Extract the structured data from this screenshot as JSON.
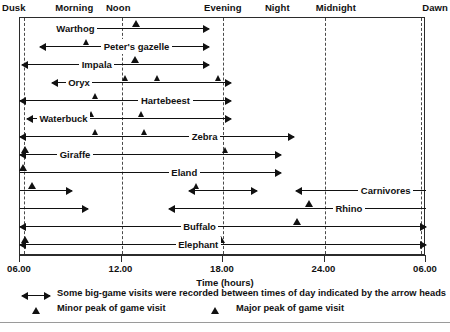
{
  "chart_data": {
    "type": "range_bar",
    "title": "",
    "xlabel": "Time (hours)",
    "ylabel": "",
    "xlim": [
      6,
      30
    ],
    "xticks": [
      {
        "value": 6,
        "label": "06.00"
      },
      {
        "value": 12,
        "label": "12.00"
      },
      {
        "value": 18,
        "label": "18.00"
      },
      {
        "value": 24,
        "label": "24.00"
      },
      {
        "value": 30,
        "label": "06.00"
      }
    ],
    "top_axis_labels": [
      {
        "label": "Dusk",
        "value": 6.0
      },
      {
        "label": "Morning",
        "value": 9.2
      },
      {
        "label": "Noon",
        "value": 12.2
      },
      {
        "label": "Evening",
        "value": 18.0
      },
      {
        "label": "Night",
        "value": 21.6
      },
      {
        "label": "Midnight",
        "value": 24.6
      },
      {
        "label": "Dawn",
        "value": 29.9
      }
    ],
    "gridlines": [
      6,
      12,
      18,
      24,
      30
    ],
    "grid": true,
    "legend_position": "below",
    "series": [
      {
        "name": "Warthog",
        "label_x": 8.0,
        "segments": [
          {
            "start": 8.1,
            "end": 17.2,
            "arrow_left": true,
            "arrow_right": true
          }
        ],
        "peaks": [
          {
            "x": 12.9,
            "type": "major"
          }
        ]
      },
      {
        "name": "Peter's gazelle",
        "label_x": 10.8,
        "segments": [
          {
            "start": 7.2,
            "end": 17.2,
            "arrow_left": true,
            "arrow_right": true
          }
        ],
        "peaks": [
          {
            "x": 10.0,
            "type": "minor"
          }
        ]
      },
      {
        "name": "Impala",
        "label_x": 9.5,
        "segments": [
          {
            "start": 6.1,
            "end": 17.2,
            "arrow_left": true,
            "arrow_right": true
          }
        ],
        "peaks": [
          {
            "x": 12.8,
            "type": "major"
          }
        ]
      },
      {
        "name": "Oryx",
        "label_x": 8.7,
        "segments": [
          {
            "start": 7.9,
            "end": 18.5,
            "arrow_left": true,
            "arrow_right": true
          }
        ],
        "peaks": [
          {
            "x": 12.3,
            "type": "minor"
          },
          {
            "x": 14.2,
            "type": "minor"
          },
          {
            "x": 17.8,
            "type": "minor"
          }
        ]
      },
      {
        "name": "Hartebeest",
        "label_x": 13.0,
        "segments": [
          {
            "start": 6.0,
            "end": 18.5,
            "arrow_left": true,
            "arrow_right": true
          }
        ],
        "peaks": [
          {
            "x": 10.5,
            "type": "minor"
          }
        ]
      },
      {
        "name": "Waterbuck",
        "label_x": 7.0,
        "segments": [
          {
            "start": 6.4,
            "end": 18.5,
            "arrow_left": true,
            "arrow_right": true
          }
        ],
        "peaks": [
          {
            "x": 10.3,
            "type": "minor"
          },
          {
            "x": 13.2,
            "type": "minor"
          }
        ]
      },
      {
        "name": "Zebra",
        "label_x": 16.0,
        "segments": [
          {
            "start": 6.0,
            "end": 22.2,
            "arrow_left": true,
            "arrow_right": true
          }
        ],
        "peaks": [
          {
            "x": 10.5,
            "type": "minor"
          },
          {
            "x": 13.4,
            "type": "minor"
          }
        ]
      },
      {
        "name": "Giraffe",
        "label_x": 8.2,
        "segments": [
          {
            "start": 6.0,
            "end": 21.4,
            "arrow_left": true,
            "arrow_right": true
          }
        ],
        "peaks": [
          {
            "x": 6.3,
            "type": "major"
          },
          {
            "x": 18.2,
            "type": "minor"
          }
        ]
      },
      {
        "name": "Eland",
        "label_x": 14.8,
        "segments": [
          {
            "start": 6.0,
            "end": 21.4,
            "arrow_left": false,
            "arrow_right": true
          }
        ],
        "peaks": [
          {
            "x": 6.2,
            "type": "major"
          }
        ]
      },
      {
        "name": "Carnivores",
        "label_x": 26.0,
        "segments": [
          {
            "start": 6.0,
            "end": 9.1,
            "arrow_left": false,
            "arrow_right": true
          },
          {
            "start": 16.0,
            "end": 20.0,
            "arrow_left": true,
            "arrow_right": true
          },
          {
            "start": 22.3,
            "end": 30.0,
            "arrow_left": true,
            "arrow_right": false
          }
        ],
        "peaks": [
          {
            "x": 6.7,
            "type": "major"
          },
          {
            "x": 16.5,
            "type": "minor"
          }
        ]
      },
      {
        "name": "Rhino",
        "label_x": 24.5,
        "segments": [
          {
            "start": 6.0,
            "end": 10.0,
            "arrow_left": false,
            "arrow_right": true
          },
          {
            "start": 14.8,
            "end": 30.0,
            "arrow_left": true,
            "arrow_right": false
          }
        ],
        "peaks": [
          {
            "x": 23.1,
            "type": "major"
          }
        ]
      },
      {
        "name": "Buffalo",
        "label_x": 15.5,
        "segments": [
          {
            "start": 6.0,
            "end": 30.0,
            "arrow_left": true,
            "arrow_right": true
          }
        ],
        "peaks": [
          {
            "x": 22.4,
            "type": "major"
          }
        ]
      },
      {
        "name": "Elephant",
        "label_x": 15.2,
        "segments": [
          {
            "start": 6.0,
            "end": 30.0,
            "arrow_left": true,
            "arrow_right": true
          }
        ],
        "peaks": [
          {
            "x": 6.3,
            "type": "major"
          },
          {
            "x": 17.9,
            "type": "major"
          }
        ]
      }
    ],
    "legend": [
      {
        "icon": "double-arrow",
        "text": "Some big-game visits were recorded between times of day indicated by the arrow heads"
      },
      {
        "icon": "triangle",
        "text": "Minor peak of game visit"
      },
      {
        "icon": "triangle",
        "text": "Major peak of game visit"
      }
    ]
  }
}
